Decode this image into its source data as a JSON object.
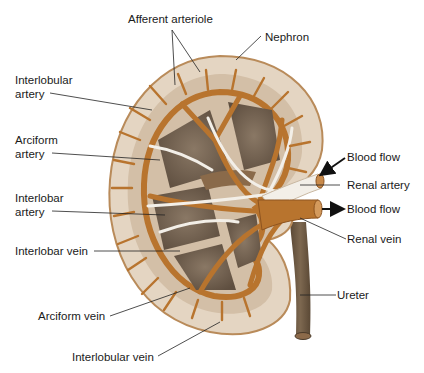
{
  "diagram": {
    "colors": {
      "capsule": "#e6d8c6",
      "cortex": "#d9c8b4",
      "vessel": "#b8742e",
      "vessel_dark": "#8e5420",
      "medulla": "#7b6a58",
      "artery_white": "#f3efe8",
      "ureter": "#6e5a44",
      "label_text": "#1a1a1a",
      "leader_line": "#222222"
    },
    "labels": {
      "afferent_arteriole": "Afferent arteriole",
      "nephron": "Nephron",
      "interlobular_artery_1": "Interlobular",
      "interlobular_artery_2": "artery",
      "arciform_artery_1": "Arciform",
      "arciform_artery_2": "artery",
      "interlobar_artery_1": "Interlobar",
      "interlobar_artery_2": "artery",
      "interlobar_vein": "Interlobar vein",
      "arciform_vein": "Arciform vein",
      "interlobular_vein": "Interlobular vein",
      "blood_flow_in": "Blood flow",
      "renal_artery": "Renal artery",
      "blood_flow_out": "Blood flow",
      "renal_vein": "Renal vein",
      "ureter": "Ureter"
    }
  }
}
